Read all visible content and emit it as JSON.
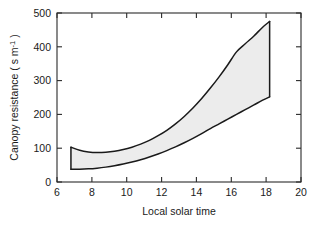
{
  "chart_data": {
    "type": "area",
    "title": "",
    "subtitle": "",
    "xlabel": "Local solar time",
    "ylabel": "Canopy resistance ( s m",
    "ylabel_sup": "-1",
    "ylabel_tail": " )",
    "xlim": [
      6,
      20
    ],
    "ylim": [
      0,
      500
    ],
    "xticks": [
      6,
      8,
      10,
      12,
      14,
      16,
      18,
      20
    ],
    "xtick_labels": [
      "6",
      "8",
      "10",
      "12",
      "14",
      "16",
      "18",
      "20"
    ],
    "yticks": [
      0,
      100,
      200,
      300,
      400,
      500
    ],
    "ytick_labels": [
      "0",
      "100",
      "200",
      "300",
      "400",
      "500"
    ],
    "grid": false,
    "legend": null,
    "band_fill_color": "#ececec",
    "line_color": "#1a1a1a",
    "axis_color": "#2a2a2a",
    "background_color": "#ffffff",
    "x": [
      6.8,
      7.3,
      7.8,
      8.3,
      8.8,
      9.3,
      9.8,
      10.3,
      10.8,
      11.3,
      11.8,
      12.3,
      12.8,
      13.3,
      13.8,
      14.3,
      14.8,
      15.3,
      15.8,
      16.3,
      16.8,
      17.3,
      17.8,
      18.2
    ],
    "series": [
      {
        "name": "upper bound",
        "values": [
          103,
          94,
          89,
          87,
          88,
          91,
          96,
          103,
          112,
          123,
          137,
          153,
          172,
          194,
          219,
          247,
          278,
          311,
          347,
          385,
          409,
          432,
          458,
          475
        ]
      },
      {
        "name": "lower bound",
        "values": [
          38,
          38,
          39,
          41,
          44,
          48,
          53,
          59,
          66,
          74,
          83,
          93,
          104,
          116,
          129,
          143,
          158,
          172,
          186,
          200,
          214,
          228,
          242,
          252
        ]
      }
    ],
    "annotations": []
  }
}
